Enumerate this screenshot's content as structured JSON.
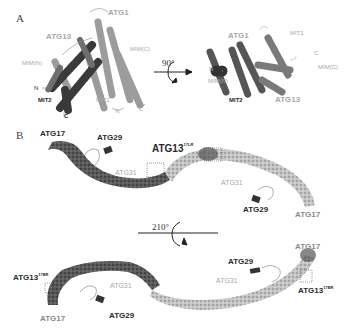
{
  "figure": {
    "panels": [
      {
        "letter": "A",
        "left_view": {
          "labels": {
            "atg1": "ATG1",
            "atg13": "ATG13",
            "mim_n": "MIM(N)",
            "mim_c": "MIM(C)",
            "n_term_left": "N",
            "mit2": "MIT2",
            "c_term_mit2": "C",
            "mit1": "MIT1",
            "n_term_mit1": "N",
            "c_term_right": "C"
          }
        },
        "rotation": {
          "angle": "90°"
        },
        "right_view": {
          "labels": {
            "atg1": "ATG1",
            "mit1": "MIT1",
            "n_term": "N",
            "c_term": "C",
            "mim_n": "MIM(N)",
            "mim_c": "MIM(C)",
            "mit2": "MIT2",
            "atg13": "ATG13"
          }
        }
      },
      {
        "letter": "B",
        "top_view": {
          "labels": {
            "atg17_left": "ATG17",
            "atg29_left": "ATG29",
            "atg31_left": "ATG31",
            "atg13": "ATG13",
            "atg13_sup": "17LR",
            "atg31_right": "ATG31",
            "atg29_right": "ATG29",
            "atg17_right": "ATG17"
          }
        },
        "rotation": {
          "angle": "210°"
        },
        "bottom_view": {
          "labels": {
            "atg13_left": "ATG13",
            "atg13_left_sup": "17BR",
            "atg31_left": "ATG31",
            "atg17_left": "ATG17",
            "atg29_left": "ATG29",
            "atg29_right": "ATG29",
            "atg31_right": "ATG31",
            "atg17_right": "ATG17",
            "atg13_right": "ATG13",
            "atg13_right_sup": "17BR"
          }
        }
      }
    ],
    "colors": {
      "dark_protein": "#555555",
      "light_protein": "#b8b8b8",
      "label_light": "#a8a8a8",
      "label_dark": "#2a2a2a"
    }
  }
}
